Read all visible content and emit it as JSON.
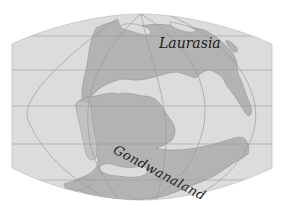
{
  "map": {
    "type": "paleogeographic world map",
    "projection": "pseudocylindrical (Robinson-like) with graticule",
    "labels": {
      "north_landmass": "Laurasia",
      "south_landmass": "Gondwanaland"
    },
    "colors": {
      "background": "#ffffff",
      "ocean": "#dcdcdc",
      "land": "#b3b3b3",
      "land_edge": "#9a9a9a",
      "graticule": "#a0a0a0",
      "label_text": "#1a1a1a"
    },
    "graticule": {
      "parallels_y_px": [
        36,
        70,
        106,
        144,
        180
      ],
      "meridians": "curved, converging toward poles"
    }
  }
}
